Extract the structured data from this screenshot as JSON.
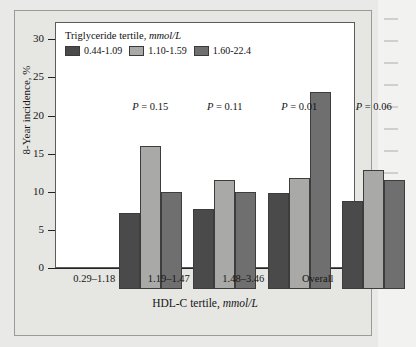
{
  "chart_data": {
    "type": "bar",
    "title": "",
    "xlabel_prefix": "HDL-C tertile, ",
    "xlabel_italic": "mmol/L",
    "ylabel": "8-Year incidence, %",
    "ylim": [
      0,
      32
    ],
    "yticks": [
      0,
      5,
      10,
      15,
      20,
      25,
      30
    ],
    "ytick_labels": [
      "0",
      "5",
      "10",
      "15",
      "20",
      "25",
      "30"
    ],
    "grid": false,
    "legend_position": "top-left-inside",
    "legend_title_prefix": "Triglyceride tertile, ",
    "legend_title_italic": "mmol/L",
    "categories": [
      "0.29–1.18",
      "1.19–1.47",
      "1.48–3.46",
      "Overall"
    ],
    "series": [
      {
        "name": "0.44-1.09",
        "color": "#4a4a4a",
        "values": [
          10.0,
          10.5,
          12.6,
          11.6
        ]
      },
      {
        "name": "1.10-1.59",
        "color": "#a9a9a7",
        "values": [
          18.8,
          14.3,
          14.5,
          15.6
        ]
      },
      {
        "name": "1.60-22.4",
        "color": "#6f6f6f",
        "values": [
          12.7,
          12.7,
          25.8,
          14.3
        ]
      }
    ],
    "annotations": [
      {
        "text_prefix": "P",
        "text_rest": " = 0.15",
        "category": "0.29–1.18"
      },
      {
        "text_prefix": "P",
        "text_rest": " = 0.11",
        "category": "1.19–1.47"
      },
      {
        "text_prefix": "P",
        "text_rest": " = 0.01",
        "category": "1.48–3.46"
      },
      {
        "text_prefix": "P",
        "text_rest": " = 0.06",
        "category": "Overall"
      }
    ]
  },
  "figure": {
    "background_color": "#e9e9e7",
    "panel_color": "#ffffff",
    "frame_color": "#9a9a96",
    "axis_color": "#232323",
    "text_color": "#161616"
  }
}
